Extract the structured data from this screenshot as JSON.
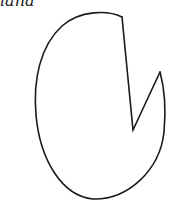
{
  "figure": {
    "label": "iana",
    "stroke_color": "#1a1a1a",
    "background": "#ffffff",
    "shape": "pie-shaped ellipse with wedge cut out",
    "wedge": {
      "top_point": [
        122,
        17
      ],
      "center_point": [
        133,
        130
      ],
      "right_point": [
        160,
        72
      ]
    }
  }
}
